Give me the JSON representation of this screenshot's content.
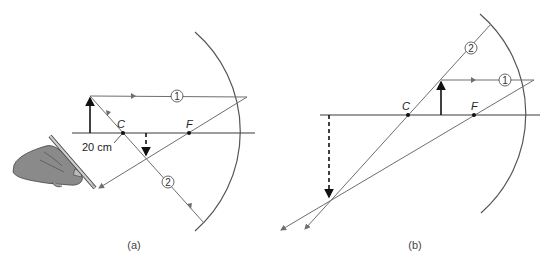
{
  "panels": [
    {
      "caption": "(a)",
      "center_label": "C",
      "focal_label": "F",
      "distance_label": "20 cm",
      "ray_labels": [
        "1",
        "2"
      ]
    },
    {
      "caption": "(b)",
      "center_label": "C",
      "focal_label": "F",
      "ray_labels": [
        "1",
        "2"
      ]
    }
  ],
  "colors": {
    "ray": "#6e6e6e",
    "object": "#111111",
    "mirror": "#555555",
    "hand": "#8a8a8a"
  }
}
